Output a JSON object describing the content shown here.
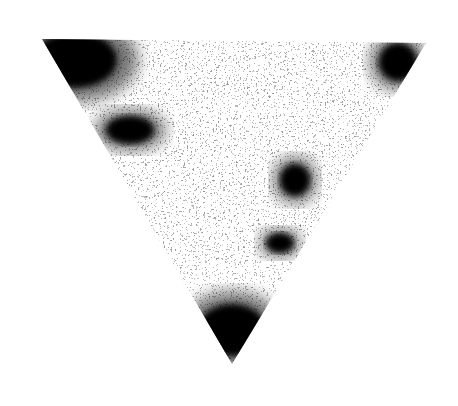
{
  "image": {
    "description": "Inverted black-and-white textured triangle with dark corners and dark spots",
    "background": "#ffffff",
    "ink": "#000000",
    "paper": "#ffffff",
    "triangle": {
      "vertices": [
        [
          42,
          39
        ],
        [
          426,
          43
        ],
        [
          232,
          364
        ]
      ]
    },
    "dark_regions": [
      {
        "name": "top-left-corner",
        "cx": 75,
        "cy": 60,
        "rx": 42,
        "ry": 28
      },
      {
        "name": "top-right-corner",
        "cx": 398,
        "cy": 62,
        "rx": 19,
        "ry": 19
      },
      {
        "name": "upper-left-smudge",
        "cx": 130,
        "cy": 130,
        "rx": 24,
        "ry": 14
      },
      {
        "name": "right-spot",
        "cx": 295,
        "cy": 180,
        "rx": 15,
        "ry": 16
      },
      {
        "name": "lower-right-spot",
        "cx": 280,
        "cy": 243,
        "rx": 14,
        "ry": 10
      },
      {
        "name": "bottom-corner",
        "cx": 232,
        "cy": 330,
        "rx": 34,
        "ry": 26
      }
    ]
  }
}
